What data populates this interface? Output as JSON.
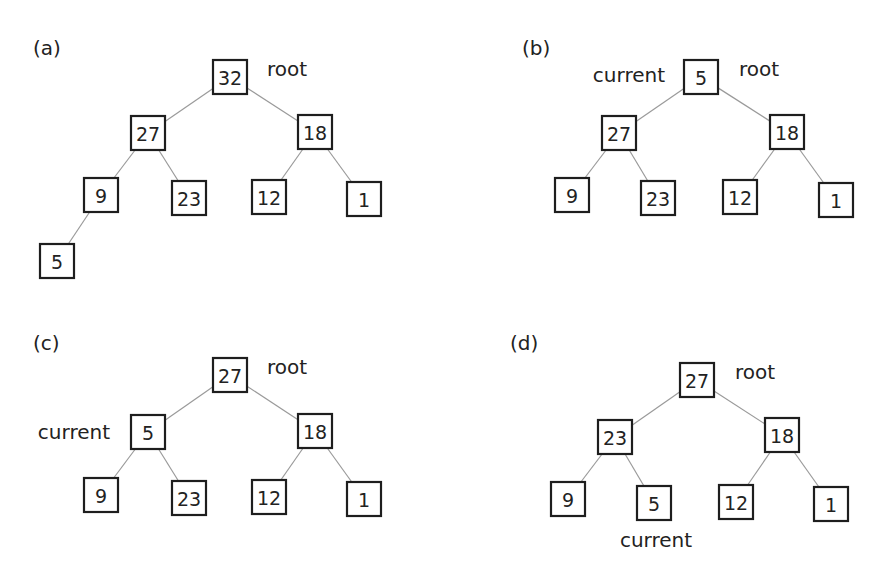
{
  "panels": [
    {
      "label": "(a)",
      "nodes": [
        {
          "id": "n0",
          "value": "32"
        },
        {
          "id": "n1",
          "value": "27"
        },
        {
          "id": "n2",
          "value": "18"
        },
        {
          "id": "n3",
          "value": "9"
        },
        {
          "id": "n4",
          "value": "23"
        },
        {
          "id": "n5",
          "value": "12"
        },
        {
          "id": "n6",
          "value": "1"
        },
        {
          "id": "n7",
          "value": "5"
        }
      ],
      "edges": [
        [
          "n0",
          "n1"
        ],
        [
          "n0",
          "n2"
        ],
        [
          "n1",
          "n3"
        ],
        [
          "n1",
          "n4"
        ],
        [
          "n2",
          "n5"
        ],
        [
          "n2",
          "n6"
        ],
        [
          "n3",
          "n7"
        ]
      ],
      "annotations": [
        {
          "text": "root",
          "node": "n0"
        }
      ]
    },
    {
      "label": "(b)",
      "nodes": [
        {
          "id": "n0",
          "value": "5"
        },
        {
          "id": "n1",
          "value": "27"
        },
        {
          "id": "n2",
          "value": "18"
        },
        {
          "id": "n3",
          "value": "9"
        },
        {
          "id": "n4",
          "value": "23"
        },
        {
          "id": "n5",
          "value": "12"
        },
        {
          "id": "n6",
          "value": "1"
        }
      ],
      "edges": [
        [
          "n0",
          "n1"
        ],
        [
          "n0",
          "n2"
        ],
        [
          "n1",
          "n3"
        ],
        [
          "n1",
          "n4"
        ],
        [
          "n2",
          "n5"
        ],
        [
          "n2",
          "n6"
        ]
      ],
      "annotations": [
        {
          "text": "current",
          "node": "n0"
        },
        {
          "text": "root",
          "node": "n0"
        }
      ]
    },
    {
      "label": "(c)",
      "nodes": [
        {
          "id": "n0",
          "value": "27"
        },
        {
          "id": "n1",
          "value": "5"
        },
        {
          "id": "n2",
          "value": "18"
        },
        {
          "id": "n3",
          "value": "9"
        },
        {
          "id": "n4",
          "value": "23"
        },
        {
          "id": "n5",
          "value": "12"
        },
        {
          "id": "n6",
          "value": "1"
        }
      ],
      "edges": [
        [
          "n0",
          "n1"
        ],
        [
          "n0",
          "n2"
        ],
        [
          "n1",
          "n3"
        ],
        [
          "n1",
          "n4"
        ],
        [
          "n2",
          "n5"
        ],
        [
          "n2",
          "n6"
        ]
      ],
      "annotations": [
        {
          "text": "root",
          "node": "n0"
        },
        {
          "text": "current",
          "node": "n1"
        }
      ]
    },
    {
      "label": "(d)",
      "nodes": [
        {
          "id": "n0",
          "value": "27"
        },
        {
          "id": "n1",
          "value": "23"
        },
        {
          "id": "n2",
          "value": "18"
        },
        {
          "id": "n3",
          "value": "9"
        },
        {
          "id": "n4",
          "value": "5"
        },
        {
          "id": "n5",
          "value": "12"
        },
        {
          "id": "n6",
          "value": "1"
        }
      ],
      "edges": [
        [
          "n0",
          "n1"
        ],
        [
          "n0",
          "n2"
        ],
        [
          "n1",
          "n3"
        ],
        [
          "n1",
          "n4"
        ],
        [
          "n2",
          "n5"
        ],
        [
          "n2",
          "n6"
        ]
      ],
      "annotations": [
        {
          "text": "root",
          "node": "n0"
        },
        {
          "text": "current",
          "node": "n4"
        }
      ]
    }
  ]
}
